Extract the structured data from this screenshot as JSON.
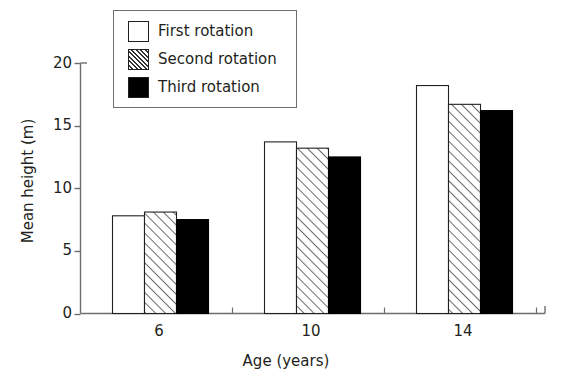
{
  "chart_data": {
    "type": "bar",
    "title": "",
    "xlabel": "Age (years)",
    "ylabel": "Mean height (m)",
    "categories": [
      "6",
      "10",
      "14"
    ],
    "series": [
      {
        "name": "First rotation",
        "fill": "white",
        "values": [
          7.8,
          13.7,
          18.2
        ]
      },
      {
        "name": "Second rotation",
        "fill": "hatch",
        "values": [
          8.1,
          13.2,
          16.7
        ]
      },
      {
        "name": "Third rotation",
        "fill": "black",
        "values": [
          7.5,
          12.5,
          16.2
        ]
      }
    ],
    "ylim": [
      0,
      20
    ],
    "yticks": [
      0,
      5,
      10,
      15,
      20
    ],
    "ytick_labels": [
      "0",
      "5",
      "10",
      "15",
      "20"
    ],
    "grid": false,
    "legend_position": "top-left",
    "axis_color": "#6d6e71",
    "bar_edge_color": "#231f20",
    "text_color": "#231f20"
  },
  "legend": {
    "items": [
      {
        "label": "First rotation",
        "swatch": "swatch-white-icon"
      },
      {
        "label": "Second rotation",
        "swatch": "swatch-hatched-icon"
      },
      {
        "label": "Third rotation",
        "swatch": "swatch-black-icon"
      }
    ]
  },
  "axes": {
    "y_title": "Mean height (m)",
    "x_title": "Age (years)",
    "y_ticks": [
      "20",
      "15",
      "10",
      "5",
      "0"
    ],
    "x_ticks": [
      "6",
      "10",
      "14"
    ]
  }
}
